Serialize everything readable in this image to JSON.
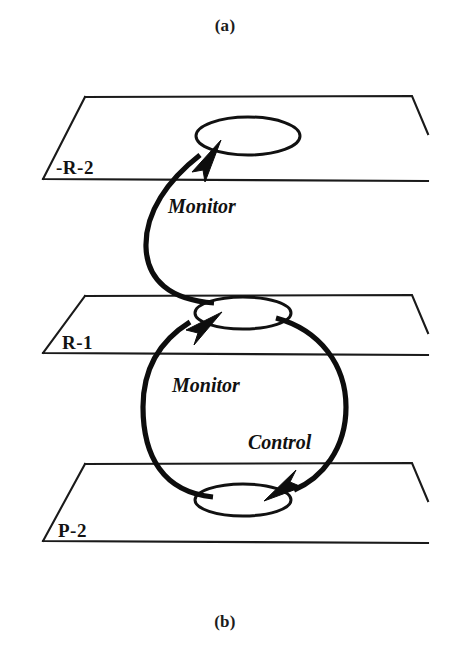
{
  "figure": {
    "caption_top": "(a)",
    "caption_bottom": "(b)",
    "background_color": "#ffffff",
    "ink_color": "#111111"
  },
  "planes": [
    {
      "id": "plane-top",
      "label": "-R-2",
      "label_x": 56,
      "label_y": 174,
      "outline": "M 85 97 L 412 96 L 428 134 M 43 179 L 428 181 M 85 97 L 43 179",
      "node": {
        "cx": 248,
        "cy": 136,
        "rx": 52,
        "ry": 19
      }
    },
    {
      "id": "plane-middle",
      "label": "R-1",
      "label_x": 62,
      "label_y": 349,
      "outline": "M 85 296 L 412 295 L 428 333 M 43 353 L 428 355 M 85 296 L 43 353",
      "node": {
        "cx": 243,
        "cy": 313,
        "rx": 48,
        "ry": 16
      }
    },
    {
      "id": "plane-bottom",
      "label": "P-2",
      "label_x": 58,
      "label_y": 537,
      "outline": "M 85 464 L 412 463 L 428 501 M 43 541 L 428 543 M 85 464 L 43 541",
      "node": {
        "cx": 243,
        "cy": 500,
        "rx": 48,
        "ry": 16
      }
    }
  ],
  "edges": [
    {
      "id": "edge-monitor-upper",
      "label": "Monitor",
      "label_x": 168,
      "label_y": 213,
      "path": "M 214 303 C 170 300 147 280 146 247 C 145 212 168 180 200 155",
      "arrow": "M 221 140 L 192 172 L 203 170 L 205 182 Z"
    },
    {
      "id": "edge-monitor-lower",
      "label": "Monitor",
      "label_x": 172,
      "label_y": 392,
      "path": "M 213 497 C 163 492 143 456 143 407 C 143 368 161 340 190 322",
      "arrow": "M 222 312 L 186 330 L 198 333 L 194 345 Z"
    },
    {
      "id": "edge-control",
      "label": "Control",
      "label_x": 248,
      "label_y": 449,
      "path": "M 276 318 C 320 330 346 365 346 407 C 346 449 322 478 294 490",
      "arrow": "M 264 501 L 302 487 L 290 482 L 296 470 Z"
    }
  ]
}
